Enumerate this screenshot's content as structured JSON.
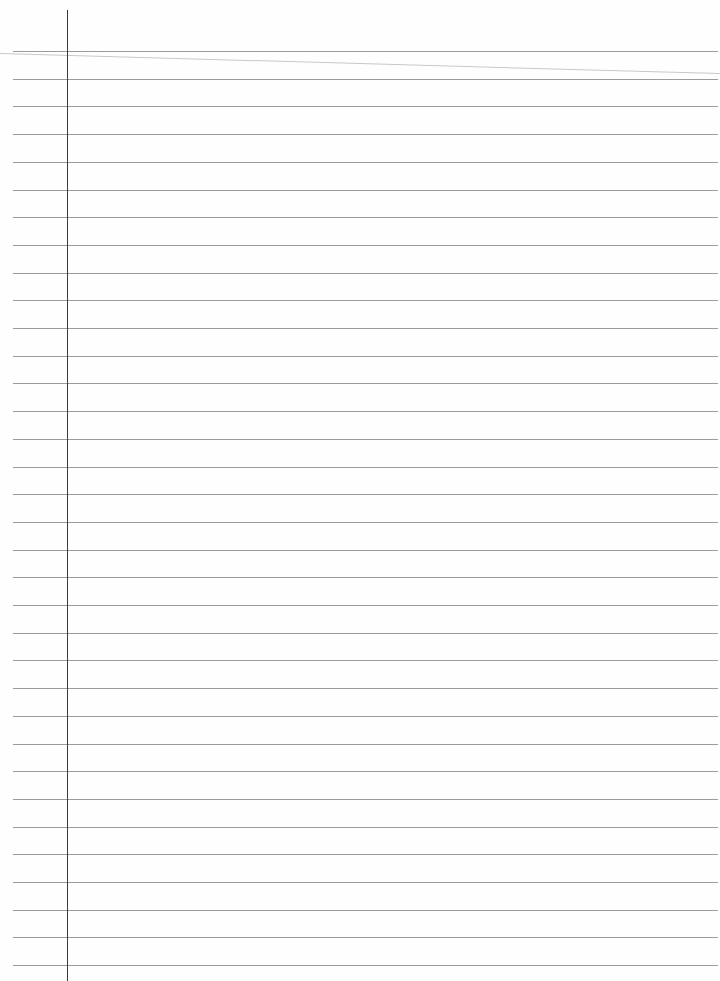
{
  "page": {
    "type": "lined-notebook-paper",
    "background_color": "#fefefe",
    "rule_color": "#8a8a8a",
    "margin_line_color": "#3a3a3a",
    "rule_count": 34,
    "first_rule_y": 51,
    "rule_spacing": 27.7,
    "margin_line_x": 67,
    "text": ""
  }
}
